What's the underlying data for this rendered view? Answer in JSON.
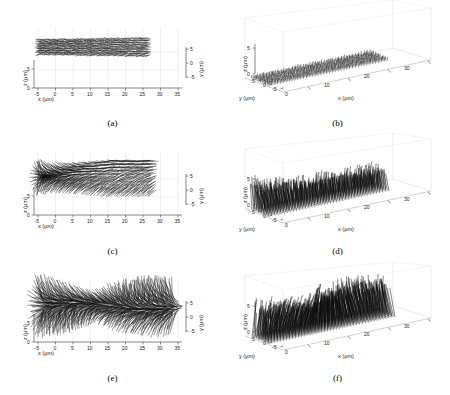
{
  "figure": {
    "background": "#ffffff",
    "vector_color": "#0a0a0a",
    "grid_color": "#d8d8d8",
    "axis_color": "#222222",
    "box_color": "#cfcfcf",
    "layout": "2 columns x 3 rows",
    "unit": "μm"
  },
  "axis_titles": {
    "x": "x (μm)",
    "y": "y (μm)",
    "z": "z (μm)"
  },
  "captions": {
    "a": "(a)",
    "b": "(b)",
    "c": "(c)",
    "d": "(d)",
    "e": "(e)",
    "f": "(f)"
  },
  "ticks_2d": {
    "x": [
      "-5",
      "0",
      "5",
      "10",
      "15",
      "20",
      "25",
      "30",
      "35"
    ],
    "z": [
      "0",
      "5"
    ],
    "y": [
      "5",
      "0",
      "-5"
    ]
  },
  "ticks_3d": {
    "x": [
      "0",
      "10",
      "20",
      "30"
    ],
    "y": [
      "5",
      "0",
      "-5"
    ],
    "z": [
      "0",
      "5"
    ]
  },
  "chart_data": {
    "type": "scatter",
    "title": "",
    "xlabel": "x (μm)",
    "ylabel": "y (μm)",
    "zlabel": "z (μm)",
    "xlim": [
      -5,
      35
    ],
    "ylim": [
      -5,
      5
    ],
    "zlim": [
      0,
      5
    ],
    "grid": true,
    "legend": null,
    "panels": [
      {
        "id": "a",
        "caption": "(a)",
        "view": "2d-projection",
        "description": "Dense uniform cross-hatched vector mesh lying nearly flat, spanning x from -5 to 29",
        "x_range": [
          -5,
          29
        ],
        "z_range": [
          2.6,
          4.6
        ],
        "divergence": "minimal",
        "xlabel": "x (μm)",
        "ylabel": "z (μm)",
        "y2label": "y (μm)",
        "xticks": [
          -5,
          0,
          5,
          10,
          15,
          20,
          25,
          30,
          35
        ],
        "zticks": [
          0,
          5
        ],
        "yticks": [
          5,
          0,
          -5
        ]
      },
      {
        "id": "b",
        "caption": "(b)",
        "view": "3d-perspective",
        "description": "Flat rectangular sheet of short vertical vectors on the floor plane of the 3D box",
        "x_range": [
          -5,
          25
        ],
        "z_range": [
          0,
          0.6
        ],
        "divergence": "minimal",
        "xlabel": "x (μm)",
        "ylabel": "y (μm)",
        "zlabel": "z (μm)",
        "xticks": [
          0,
          10,
          20,
          30
        ],
        "yticks": [
          5,
          0,
          -5
        ],
        "zticks": [
          0,
          5
        ]
      },
      {
        "id": "c",
        "caption": "(c)",
        "view": "2d-projection",
        "description": "Vectors fan upward and outward, strong splay at left edge, dense tilted bundle to the right",
        "x_range": [
          -5,
          30
        ],
        "z_range": [
          1.0,
          5.0
        ],
        "divergence": "moderate",
        "xlabel": "x (μm)",
        "ylabel": "z (μm)",
        "y2label": "y (μm)",
        "xticks": [
          -5,
          0,
          5,
          10,
          15,
          20,
          25,
          30,
          35
        ],
        "zticks": [
          0,
          5
        ],
        "yticks": [
          5,
          0,
          -5
        ]
      },
      {
        "id": "d",
        "caption": "(d)",
        "view": "3d-perspective",
        "description": "Tall splayed vector spikes rising from the floor plane across the box",
        "x_range": [
          -5,
          26
        ],
        "z_range": [
          0,
          4.0
        ],
        "divergence": "moderate",
        "xlabel": "x (μm)",
        "ylabel": "y (μm)",
        "zlabel": "z (μm)",
        "xticks": [
          0,
          10,
          20,
          30
        ],
        "yticks": [
          5,
          0,
          -5
        ],
        "zticks": [
          0,
          5
        ]
      },
      {
        "id": "e",
        "caption": "(e)",
        "view": "2d-projection",
        "description": "Strongly divergent vectors forming two fan clusters with a dip near x = 16, extending to x = 34",
        "x_range": [
          -5,
          34
        ],
        "z_range": [
          0.8,
          5.2
        ],
        "divergence": "strong",
        "xlabel": "x (μm)",
        "ylabel": "z (μm)",
        "y2label": "y (μm)",
        "xticks": [
          -5,
          0,
          5,
          10,
          15,
          20,
          25,
          30,
          35
        ],
        "zticks": [
          0,
          5
        ],
        "yticks": [
          5,
          0,
          -5
        ]
      },
      {
        "id": "f",
        "caption": "(f)",
        "view": "3d-perspective",
        "description": "Tall strongly splayed spikes with a dense dark cluster near the centre of the box",
        "x_range": [
          -5,
          30
        ],
        "z_range": [
          0,
          4.6
        ],
        "divergence": "strong",
        "xlabel": "x (μm)",
        "ylabel": "y (μm)",
        "zlabel": "z (μm)",
        "xticks": [
          0,
          10,
          20,
          30
        ],
        "yticks": [
          5,
          0,
          -5
        ],
        "zticks": [
          0,
          5
        ]
      }
    ]
  }
}
